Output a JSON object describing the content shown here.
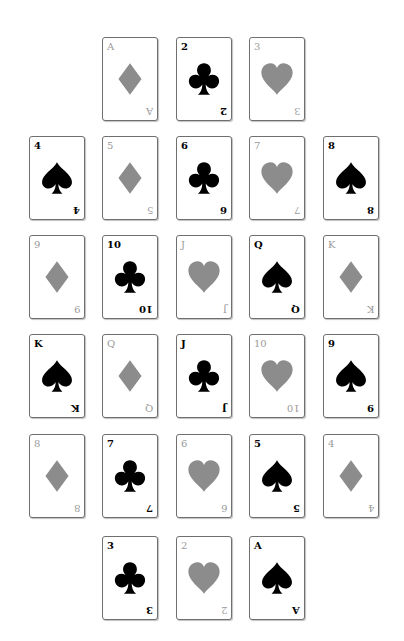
{
  "colors": {
    "black_suit": "#000000",
    "red_suit": "#8c8c8c",
    "card_border": "#6f6f6f",
    "background": "#ffffff"
  },
  "layout": {
    "col_x": [
      29,
      102,
      176,
      249,
      323
    ],
    "row_y": [
      37,
      136,
      235,
      334,
      434,
      536
    ]
  },
  "rows": [
    {
      "cards": [
        {
          "col": 1,
          "rank": "A",
          "suit": "diamond"
        },
        {
          "col": 2,
          "rank": "2",
          "suit": "club"
        },
        {
          "col": 3,
          "rank": "3",
          "suit": "heart"
        }
      ]
    },
    {
      "cards": [
        {
          "col": 0,
          "rank": "4",
          "suit": "spade"
        },
        {
          "col": 1,
          "rank": "5",
          "suit": "diamond"
        },
        {
          "col": 2,
          "rank": "6",
          "suit": "club"
        },
        {
          "col": 3,
          "rank": "7",
          "suit": "heart"
        },
        {
          "col": 4,
          "rank": "8",
          "suit": "spade"
        }
      ]
    },
    {
      "cards": [
        {
          "col": 0,
          "rank": "9",
          "suit": "diamond"
        },
        {
          "col": 1,
          "rank": "10",
          "suit": "club"
        },
        {
          "col": 2,
          "rank": "J",
          "suit": "heart"
        },
        {
          "col": 3,
          "rank": "Q",
          "suit": "spade"
        },
        {
          "col": 4,
          "rank": "K",
          "suit": "diamond"
        }
      ]
    },
    {
      "cards": [
        {
          "col": 0,
          "rank": "K",
          "suit": "spade"
        },
        {
          "col": 1,
          "rank": "Q",
          "suit": "diamond"
        },
        {
          "col": 2,
          "rank": "J",
          "suit": "club"
        },
        {
          "col": 3,
          "rank": "10",
          "suit": "heart"
        },
        {
          "col": 4,
          "rank": "9",
          "suit": "spade"
        }
      ]
    },
    {
      "cards": [
        {
          "col": 0,
          "rank": "8",
          "suit": "diamond"
        },
        {
          "col": 1,
          "rank": "7",
          "suit": "club"
        },
        {
          "col": 2,
          "rank": "6",
          "suit": "heart"
        },
        {
          "col": 3,
          "rank": "5",
          "suit": "spade"
        },
        {
          "col": 4,
          "rank": "4",
          "suit": "diamond"
        }
      ]
    },
    {
      "cards": [
        {
          "col": 1,
          "rank": "3",
          "suit": "club"
        },
        {
          "col": 2,
          "rank": "2",
          "suit": "heart"
        },
        {
          "col": 3,
          "rank": "A",
          "suit": "spade"
        }
      ]
    }
  ]
}
